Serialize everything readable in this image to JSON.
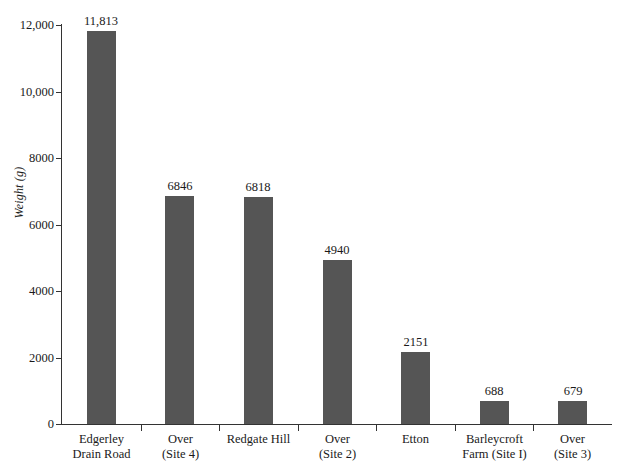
{
  "chart_data": {
    "type": "bar",
    "title": "",
    "subtitle": "",
    "xlabel": "",
    "ylabel": "Weight (g)",
    "ylim": [
      0,
      12000
    ],
    "grid": false,
    "legend": null,
    "orientation": "vertical",
    "bar_color": "#555555",
    "axis_color": "#333333",
    "background_color": "#ffffff",
    "y_ticks": [
      0,
      2000,
      4000,
      6000,
      8000,
      10000,
      12000
    ],
    "y_tick_labels": [
      "0",
      "2000",
      "4000",
      "6000",
      "8000",
      "10,000",
      "12,000"
    ],
    "categories": [
      "Edgerley Drain Road",
      "Over (Site 4)",
      "Redgate Hill",
      "Over (Site 2)",
      "Etton",
      "Barleycroft Farm (Site I)",
      "Over (Site 3)"
    ],
    "category_label_lines": [
      [
        "Edgerley",
        "Drain Road"
      ],
      [
        "Over",
        "(Site 4)"
      ],
      [
        "Redgate Hill",
        ""
      ],
      [
        "Over",
        "(Site 2)"
      ],
      [
        "Etton",
        ""
      ],
      [
        "Barleycroft",
        "Farm (Site I)"
      ],
      [
        "Over",
        "(Site 3)"
      ]
    ],
    "values": [
      11813,
      6846,
      6818,
      4940,
      2151,
      688,
      679
    ],
    "value_labels": [
      "11,813",
      "6846",
      "6818",
      "4940",
      "2151",
      "688",
      "679"
    ]
  }
}
